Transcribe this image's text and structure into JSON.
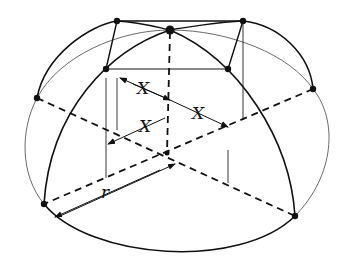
{
  "diagram": {
    "labels": {
      "x_top": "X",
      "x_right": "X",
      "x_left": "X",
      "radius": "r"
    },
    "colors": {
      "ink": "#111111",
      "faint": "#555555",
      "background": "#ffffff"
    }
  }
}
